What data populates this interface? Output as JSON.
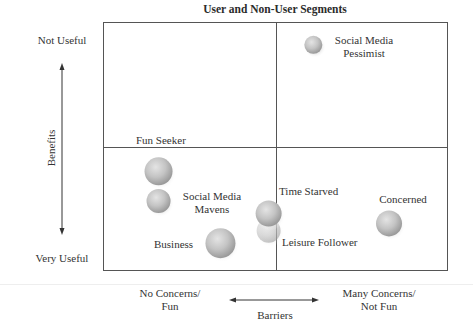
{
  "chart_data": {
    "type": "scatter",
    "subtype": "bubble-quadrant",
    "title": "User and Non-User Segments",
    "xlabel": "Barriers",
    "ylabel": "Benefits",
    "x_axis": {
      "low_label": [
        "No Concerns/",
        "Fun"
      ],
      "high_label": [
        "Many Concerns/",
        "Not Fun"
      ],
      "range": [
        0,
        100
      ],
      "divider": 50
    },
    "y_axis": {
      "low_label": "Very Useful",
      "high_label": "Not Useful",
      "range": [
        0,
        100
      ],
      "divider": 50
    },
    "grid": false,
    "legend": "none",
    "points": [
      {
        "name": "Social Media Pessimist",
        "label_lines": [
          "Social Media",
          "Pessimist"
        ],
        "x": 61,
        "y": 91,
        "size": 9,
        "opacity": 1.0
      },
      {
        "name": "Fun Seeker",
        "label_lines": [
          "Fun Seeker"
        ],
        "x": 16,
        "y": 40,
        "size": 14,
        "opacity": 1.0
      },
      {
        "name": "Social Media Mavens",
        "label_lines": [
          "Social Media",
          "Mavens"
        ],
        "x": 16,
        "y": 28,
        "size": 12,
        "opacity": 1.0
      },
      {
        "name": "Leisure Follower",
        "label_lines": [
          "Leisure Follower"
        ],
        "x": 48,
        "y": 16,
        "size": 12,
        "opacity": 0.55
      },
      {
        "name": "Time Starved",
        "label_lines": [
          "Time Starved"
        ],
        "x": 48,
        "y": 23,
        "size": 13,
        "opacity": 1.0
      },
      {
        "name": "Business",
        "label_lines": [
          "Business"
        ],
        "x": 34,
        "y": 11,
        "size": 15,
        "opacity": 1.0
      },
      {
        "name": "Concerned",
        "label_lines": [
          "Concerned"
        ],
        "x": 83,
        "y": 19,
        "size": 13,
        "opacity": 1.0
      }
    ]
  }
}
